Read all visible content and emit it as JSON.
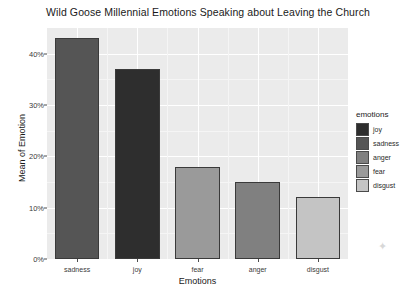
{
  "chart_data": {
    "type": "bar",
    "title": "Wild Goose Millennial Emotions Speaking about Leaving the Church",
    "xlabel": "Emotions",
    "ylabel": "Mean of Emotion",
    "categories": [
      "sadness",
      "joy",
      "fear",
      "anger",
      "disgust"
    ],
    "values": [
      43,
      37,
      18,
      15,
      12
    ],
    "value_labels": [
      "43%",
      "37%",
      "18%",
      "15%",
      "12%"
    ],
    "ylim": [
      0,
      45
    ],
    "ytick_labels": [
      "0%",
      "10%",
      "20%",
      "30%",
      "40%"
    ],
    "ytick_values": [
      0,
      10,
      20,
      30,
      40
    ],
    "grid": true,
    "legend_position": "right",
    "legend_title": "emotions",
    "legend_entries": [
      {
        "label": "joy",
        "color": "#2e2e2e"
      },
      {
        "label": "sadness",
        "color": "#555555"
      },
      {
        "label": "anger",
        "color": "#808080"
      },
      {
        "label": "fear",
        "color": "#9a9a9a"
      },
      {
        "label": "disgust",
        "color": "#c4c4c4"
      }
    ],
    "bar_colors": [
      "#555555",
      "#2e2e2e",
      "#9a9a9a",
      "#808080",
      "#c4c4c4"
    ],
    "panel_background": "#ebebeb",
    "gridline_color": "#ffffff"
  }
}
